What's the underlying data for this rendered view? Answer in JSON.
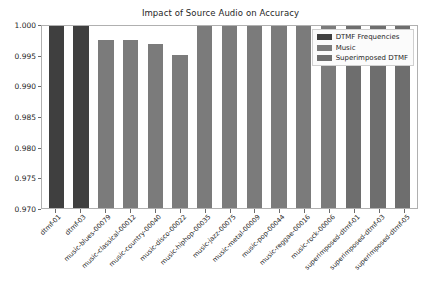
{
  "chart_data": {
    "type": "bar",
    "title": "Impact of Source Audio on Accuracy",
    "xlabel": "",
    "ylabel": "",
    "ylim": [
      0.97,
      1.0
    ],
    "yticks": [
      "0.970",
      "0.975",
      "0.980",
      "0.985",
      "0.990",
      "0.995",
      "1.000"
    ],
    "ytick_values": [
      0.97,
      0.975,
      0.98,
      0.985,
      0.99,
      0.995,
      1.0
    ],
    "grid": false,
    "legend_position": "upper right",
    "categories": [
      "dtmf-01",
      "dtmf-03",
      "music-blues-00079",
      "music-classical-00012",
      "music-country-00040",
      "music-disco-00022",
      "music-hiphop-00035",
      "music-jazz-00075",
      "music-metal-00009",
      "music-pop-00044",
      "music-reggae-00016",
      "music-rock-00006",
      "superimposed-dtmf-01",
      "superimposed-dtmf-03",
      "superimposed-dtmf-05"
    ],
    "values": [
      0.9996,
      1.0,
      0.9974,
      0.9974,
      0.9967,
      0.995,
      0.9996,
      1.0,
      1.0,
      1.0,
      1.0,
      1.0,
      1.0,
      1.0,
      1.0
    ],
    "bar_groups": [
      "DTMF Frequencies",
      "DTMF Frequencies",
      "Music",
      "Music",
      "Music",
      "Music",
      "Music",
      "Music",
      "Music",
      "Music",
      "Music",
      "Music",
      "Superimposed DTMF",
      "Superimposed DTMF",
      "Superimposed DTMF"
    ],
    "legend": [
      {
        "label": "DTMF Frequencies",
        "color": "#3f3f3f"
      },
      {
        "label": "Music",
        "color": "#7b7b7b"
      },
      {
        "label": "Superimposed DTMF",
        "color": "#6e6e6e"
      }
    ]
  }
}
